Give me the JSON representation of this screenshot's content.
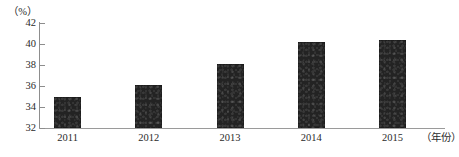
{
  "chart_data": {
    "type": "bar",
    "title": "",
    "xlabel": "（年份）",
    "ylabel": "（%）",
    "categories": [
      "2011",
      "2012",
      "2013",
      "2014",
      "2015"
    ],
    "values": [
      35.0,
      36.1,
      38.1,
      40.2,
      40.4
    ],
    "series": [
      {
        "name": "",
        "values": [
          35.0,
          36.1,
          38.1,
          40.2,
          40.4
        ]
      }
    ],
    "ylim": [
      32,
      42
    ],
    "y_ticks": [
      32,
      34,
      36,
      38,
      40,
      42
    ],
    "y_tick_labels": [
      "32",
      "34",
      "36",
      "38",
      "40",
      "42"
    ],
    "x_tick_labels": [
      "2011",
      "2012",
      "2013",
      "2014",
      "2015"
    ],
    "grid": false,
    "legend": false,
    "legend_position": "none",
    "bar_color": "#232323",
    "axis_color": "#8d8d8d",
    "background_color": "#ffffff"
  },
  "axis": {
    "unit_top_left": "（%）",
    "unit_bottom_right": "（年份）"
  }
}
